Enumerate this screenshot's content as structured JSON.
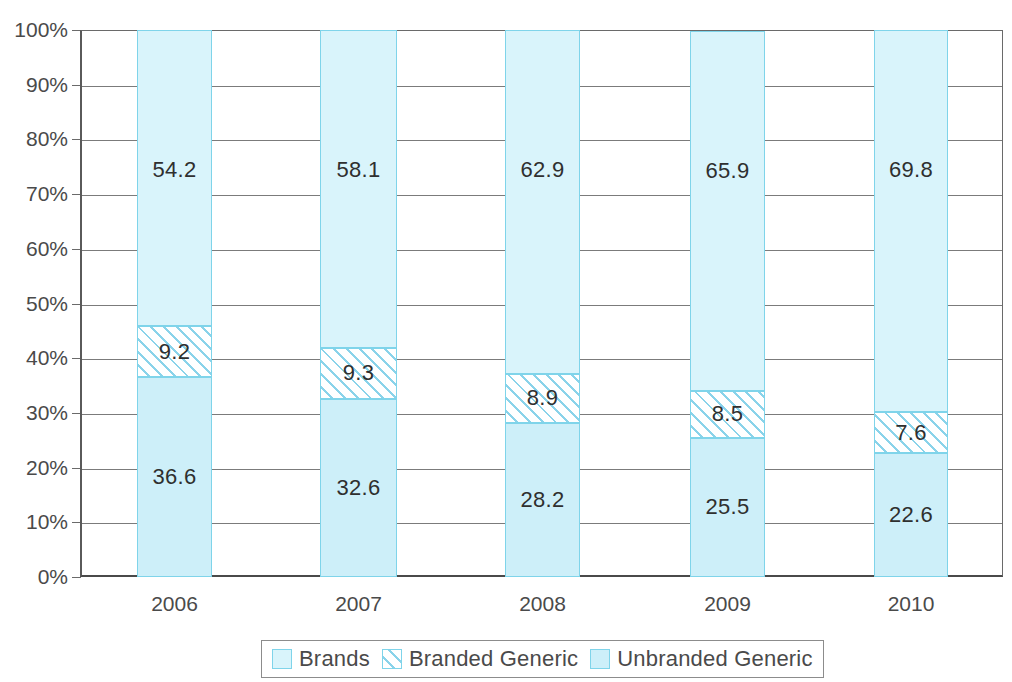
{
  "chart_data": {
    "type": "bar",
    "subtype": "stacked-100-percent",
    "title": "",
    "xlabel": "",
    "ylabel": "",
    "categories": [
      "2006",
      "2007",
      "2008",
      "2009",
      "2010"
    ],
    "ylim": [
      0,
      100
    ],
    "ytick_labels": [
      "0%",
      "10%",
      "20%",
      "30%",
      "40%",
      "50%",
      "60%",
      "70%",
      "80%",
      "90%",
      "100%"
    ],
    "ytick_values": [
      0,
      10,
      20,
      30,
      40,
      50,
      60,
      70,
      80,
      90,
      100
    ],
    "grid": true,
    "legend_position": "bottom",
    "stack_order_bottom_to_top": [
      "Unbranded Generic",
      "Branded Generic",
      "Brands"
    ],
    "series": [
      {
        "name": "Unbranded Generic",
        "values": [
          36.6,
          32.6,
          28.2,
          25.5,
          22.6
        ],
        "labels": [
          "36.6",
          "32.6",
          "28.2",
          "25.5",
          "22.6"
        ],
        "color": "#cdeff9",
        "pattern": "solid"
      },
      {
        "name": "Branded Generic",
        "values": [
          9.2,
          9.3,
          8.9,
          8.5,
          7.6
        ],
        "labels": [
          "9.2",
          "9.3",
          "8.9",
          "8.5",
          "7.6"
        ],
        "color": "#ffffff",
        "pattern": "diagonal-hatch"
      },
      {
        "name": "Brands",
        "values": [
          54.2,
          58.1,
          62.9,
          65.9,
          69.8
        ],
        "labels": [
          "54.2",
          "58.1",
          "62.9",
          "65.9",
          "69.8"
        ],
        "color": "#d9f4fb",
        "pattern": "solid"
      }
    ]
  },
  "legend": {
    "items": [
      {
        "label": "Brands",
        "swatch": "seg-brands"
      },
      {
        "label": "Branded Generic",
        "swatch": "seg-branded"
      },
      {
        "label": "Unbranded Generic",
        "swatch": "seg-unbranded"
      }
    ]
  },
  "colors": {
    "segment_border": "#7fd4ea",
    "gridline": "#7b7b7b",
    "axis": "#4a4a4a",
    "text": "#3a3a3a"
  }
}
